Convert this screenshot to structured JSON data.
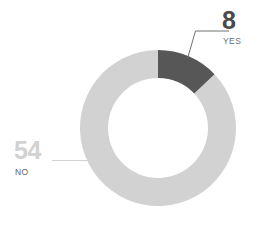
{
  "chart_data": {
    "type": "pie",
    "variant": "donut",
    "title": "",
    "subtitle": "",
    "xlabel": "",
    "ylabel": "",
    "total": 62,
    "categories": [
      "YES",
      "NO"
    ],
    "values": [
      8,
      54
    ],
    "labels": [
      {
        "name": "YES",
        "value": "8",
        "percent": 12.9,
        "color": "#575757"
      },
      {
        "name": "NO",
        "value": "54",
        "percent": 87.1,
        "color": "#d2d2d2"
      }
    ],
    "legend": "none",
    "grid": false,
    "start_angle_deg": 0,
    "direction": "clockwise",
    "annotations": [
      {
        "text": "8",
        "role": "slice-value",
        "position": "top-right"
      },
      {
        "text": "YES",
        "role": "slice-label",
        "position": "top-right"
      },
      {
        "text": "54",
        "role": "slice-value",
        "position": "left"
      },
      {
        "text": "NO",
        "role": "slice-label",
        "position": "left"
      }
    ]
  },
  "colors": {
    "background": "#ffffff",
    "yes_slice": "#575757",
    "no_slice": "#d2d2d2",
    "leader_line_dark": "#707070",
    "leader_line_light": "#d2d2d2",
    "value_text_dark": "#4a4a4a",
    "value_text_light": "#d2d2d2",
    "name_text": "#6e6e6e"
  },
  "donut": {
    "center_x": 158,
    "center_y": 128,
    "outer_radius": 78,
    "inner_radius": 50
  },
  "yes_label": {
    "value": "8",
    "name": "YES"
  },
  "no_label": {
    "value": "54",
    "name": "NO"
  }
}
